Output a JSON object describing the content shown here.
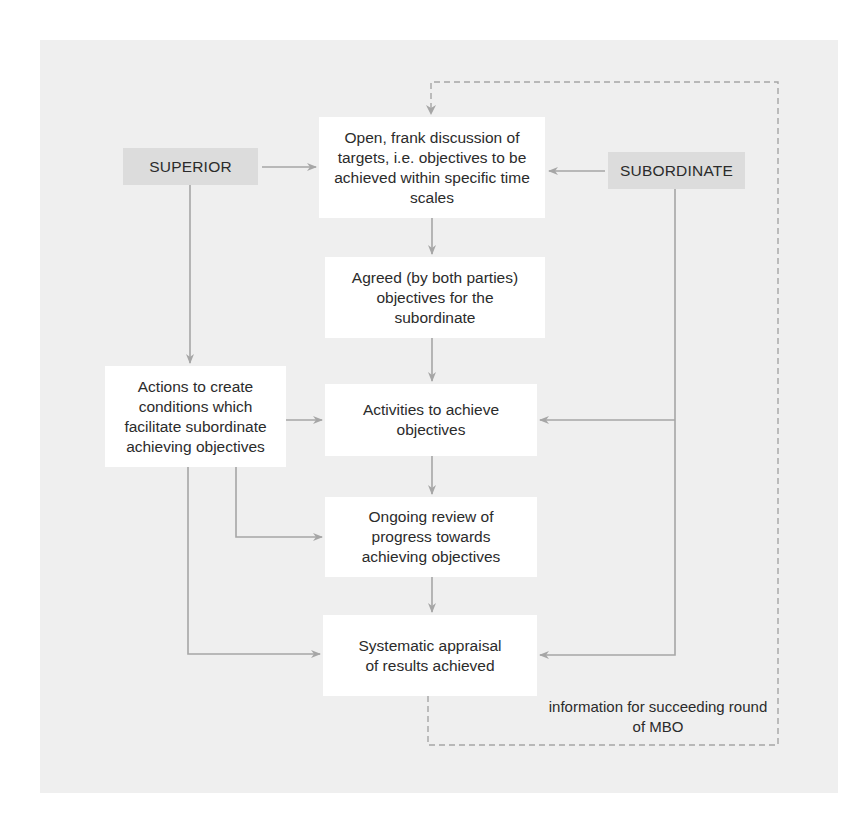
{
  "diagram": {
    "type": "flowchart",
    "actors": {
      "superior": "SUPERIOR",
      "subordinate": "SUBORDINATE"
    },
    "steps": [
      {
        "id": "discussion",
        "label": "Open, frank discussion of targets, i.e. objectives to be achieved within specific time scales"
      },
      {
        "id": "agreed",
        "label": "Agreed (by both parties) objectives for the subordinate"
      },
      {
        "id": "activities",
        "label": "Activities to achieve objectives"
      },
      {
        "id": "review",
        "label": "Ongoing review of progress towards achieving objectives"
      },
      {
        "id": "appraisal",
        "label": "Systematic appraisal of results achieved"
      }
    ],
    "side_step": {
      "id": "actions",
      "label": "Actions to create conditions which facilitate subordinate achieving objectives"
    },
    "feedback_note": "information for succeeding round of MBO",
    "edges": [
      {
        "from": "superior",
        "to": "discussion"
      },
      {
        "from": "subordinate",
        "to": "discussion"
      },
      {
        "from": "discussion",
        "to": "agreed"
      },
      {
        "from": "agreed",
        "to": "activities"
      },
      {
        "from": "activities",
        "to": "review"
      },
      {
        "from": "review",
        "to": "appraisal"
      },
      {
        "from": "superior",
        "to": "actions"
      },
      {
        "from": "actions",
        "to": "activities"
      },
      {
        "from": "actions",
        "to": "review"
      },
      {
        "from": "actions",
        "to": "appraisal"
      },
      {
        "from": "subordinate",
        "to": "activities"
      },
      {
        "from": "subordinate",
        "to": "appraisal"
      },
      {
        "from": "appraisal",
        "to": "discussion",
        "style": "dashed",
        "label": "information for succeeding round of MBO"
      }
    ],
    "colors": {
      "panel_bg": "#efefef",
      "actor_bg": "#dcdcdc",
      "box_bg": "#ffffff",
      "line": "#a6a6a6",
      "text": "#2b2b2b"
    }
  }
}
